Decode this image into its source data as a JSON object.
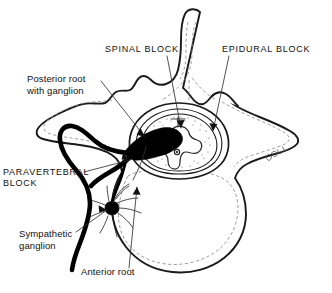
{
  "figure": {
    "background_color": "#ffffff",
    "ink_color": "#111111",
    "dashed_contour_color": "#8d8d8d"
  },
  "labels": {
    "spinal_block": "SPINAL BLOCK",
    "epidural_block": "EPIDURAL BLOCK",
    "posterior_root": "Posterior root\nwith ganglion",
    "paravertebral_block": "PARAVERTEBRAL\nBLOCK",
    "sympathetic_ganglion": "Sympathetic\nganglion",
    "anterior_root": "Anterior root"
  },
  "structures": [
    {
      "name": "spinous-process",
      "description": "Vertical finger-shaped bony projection at top center"
    },
    {
      "name": "transverse-process-left",
      "description": "Wing-like lateral bony projection on the left"
    },
    {
      "name": "transverse-process-right",
      "description": "Wing-like lateral bony projection on the right"
    },
    {
      "name": "vertebral-body",
      "description": "Large rounded mass at bottom center with dashed inner contour"
    },
    {
      "name": "vertebral-canal",
      "description": "Oval canal containing the spinal cord and meninges"
    },
    {
      "name": "spinal-cord",
      "description": "Butterfly-shaped gray matter within the cord"
    },
    {
      "name": "central-canal",
      "description": "Small central opening in the spinal cord"
    },
    {
      "name": "epidural-space",
      "description": "Stippled ring between dura and canal wall"
    },
    {
      "name": "spinal-nerve-trunk",
      "description": "Thick black nerve emerging laterally to the left"
    },
    {
      "name": "dorsal-root-ganglion",
      "description": "Bulging swelling on the posterior root"
    },
    {
      "name": "ramus-communicans",
      "description": "Thin black branch descending to the sympathetic chain"
    },
    {
      "name": "sympathetic-ganglion-node",
      "description": "Small dark node with radiating fine fibers"
    }
  ],
  "signature": "artist-signature-mark"
}
